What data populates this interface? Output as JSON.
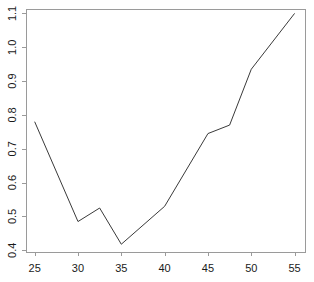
{
  "chart_data": {
    "type": "line",
    "title": "",
    "subtitle": "",
    "xlabel": "",
    "ylabel": "",
    "xlim": [
      24,
      56.2
    ],
    "ylim": [
      0.4,
      1.11
    ],
    "xticks": [
      25,
      30,
      35,
      40,
      45,
      50,
      55
    ],
    "xtick_labels": [
      "25",
      "30",
      "35",
      "40",
      "45",
      "50",
      "55"
    ],
    "yticks": [
      0.4,
      0.5,
      0.6,
      0.7,
      0.8,
      0.9,
      1.0,
      1.1
    ],
    "ytick_labels": [
      "0.4",
      "0.5",
      "0.6",
      "0.7",
      "0.8",
      "0.9",
      "1.0",
      "1.1"
    ],
    "grid": false,
    "legend": false,
    "legend_position": "none",
    "ytick_label_rotation": -90,
    "line_color": "#3a3a3a",
    "frame_color": "#9a9a9a",
    "background_color": "#ffffff",
    "x": [
      25,
      30,
      32.5,
      35,
      40,
      45,
      47.5,
      50,
      55
    ],
    "y": [
      0.78,
      0.485,
      0.525,
      0.418,
      0.53,
      0.745,
      0.77,
      0.935,
      1.1
    ],
    "series": [
      {
        "name": "series-1",
        "x": [
          25,
          30,
          32.5,
          35,
          40,
          45,
          47.5,
          50,
          55
        ],
        "values": [
          0.78,
          0.485,
          0.525,
          0.418,
          0.53,
          0.745,
          0.77,
          0.935,
          1.1
        ]
      }
    ],
    "annotations": []
  },
  "geometry": {
    "plot_left": 26,
    "plot_right": 305,
    "plot_top": 9,
    "plot_bottom": 252,
    "x_min": 24,
    "x_max": 56.2,
    "y_min": 0.395,
    "y_max": 1.113,
    "tick_length": 4,
    "x_label_offset": 17,
    "y_label_offset": 9
  }
}
